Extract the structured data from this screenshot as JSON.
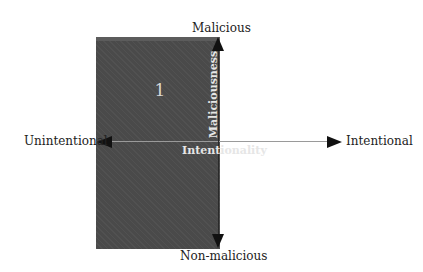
{
  "diagram": {
    "quadrant": {
      "number": "1",
      "fill": "#4a4a4a"
    },
    "axes": {
      "vertical": {
        "title": "Maliciousness",
        "top_label": "Malicious",
        "bottom_label": "Non-malicious"
      },
      "horizontal": {
        "title": "Intentionality",
        "left_label": "Unintentional",
        "right_label": "Intentional"
      }
    }
  }
}
